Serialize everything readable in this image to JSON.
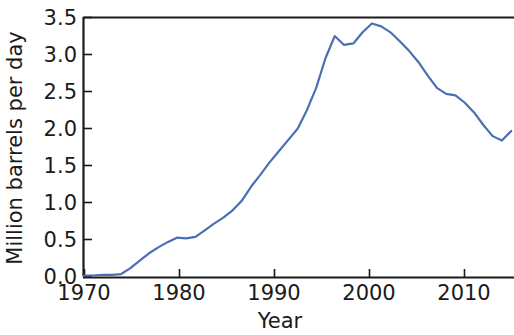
{
  "chart_data": {
    "type": "line",
    "title": "",
    "subtitle": "",
    "xlabel": "Year",
    "ylabel": "Million barrels per day",
    "xlim": [
      1970,
      2016.3
    ],
    "ylim": [
      0.0,
      3.5
    ],
    "xticks": [
      1970,
      1980,
      1990,
      2000,
      2010
    ],
    "xtick_labels": [
      "1970",
      "1980",
      "1990",
      "2000",
      "2010"
    ],
    "yticks": [
      0.0,
      0.5,
      1.0,
      1.5,
      2.0,
      2.5,
      3.0,
      3.5
    ],
    "ytick_labels": [
      "0.0",
      "0.5",
      "1.0",
      "1.5",
      "2.0",
      "2.5",
      "3.0",
      "3.5"
    ],
    "grid": false,
    "legend": null,
    "line_color": "#4a6fb5",
    "series": [
      {
        "name": "Million barrels per day",
        "x": [
          1970,
          1971,
          1972,
          1973,
          1974,
          1975,
          1976,
          1977,
          1978,
          1979,
          1980,
          1981,
          1982,
          1983,
          1984,
          1985,
          1986,
          1987,
          1988,
          1989,
          1990,
          1991,
          1992,
          1993,
          1994,
          1995,
          1996,
          1997,
          1998,
          1999,
          2000,
          2001,
          2002,
          2003,
          2004,
          2005,
          2006,
          2007,
          2008,
          2009,
          2010,
          2011,
          2012,
          2013,
          2014,
          2015,
          2016
        ],
        "values": [
          0.02,
          0.02,
          0.03,
          0.03,
          0.04,
          0.12,
          0.22,
          0.32,
          0.4,
          0.47,
          0.53,
          0.52,
          0.54,
          0.63,
          0.72,
          0.8,
          0.9,
          1.03,
          1.22,
          1.38,
          1.55,
          1.7,
          1.85,
          2.0,
          2.25,
          2.55,
          2.95,
          3.25,
          3.13,
          3.15,
          3.3,
          3.42,
          3.38,
          3.3,
          3.18,
          3.05,
          2.9,
          2.72,
          2.55,
          2.47,
          2.45,
          2.35,
          2.22,
          2.05,
          1.9,
          1.84,
          1.97
        ]
      }
    ]
  },
  "axes": {
    "x_title": "Year",
    "y_title": "Million barrels per day"
  }
}
